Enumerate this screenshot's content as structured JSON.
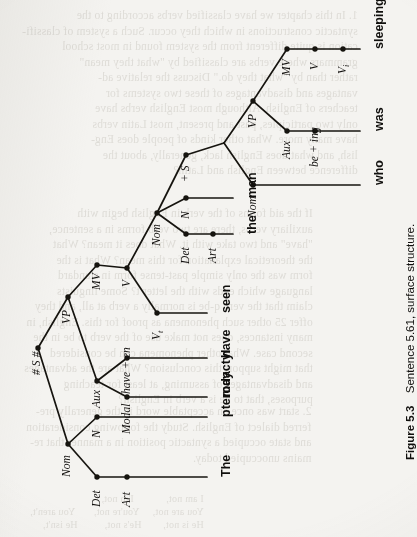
{
  "figure": {
    "caption_label": "Figure 5.3",
    "caption_text": "Sentence 5.61, surface structure.",
    "orientation": "rotated-90-ccw"
  },
  "tree": {
    "root_label": "# S #",
    "nodes": [
      {
        "id": "S",
        "label": "# S #",
        "style": "italic",
        "x": 38,
        "y": 348
      },
      {
        "id": "VP1",
        "label": "VP",
        "style": "italic",
        "x": 68,
        "y": 297
      },
      {
        "id": "Nom1",
        "label": "Nom",
        "style": "italic",
        "x": 68,
        "y": 444
      },
      {
        "id": "Det1",
        "label": "Det",
        "style": "italic",
        "x": 97,
        "y": 477
      },
      {
        "id": "N1",
        "label": "N",
        "style": "italic",
        "x": 97,
        "y": 417
      },
      {
        "id": "Art1",
        "label": "Art",
        "style": "italic",
        "x": 127,
        "y": 477
      },
      {
        "id": "Aux1",
        "label": "Aux",
        "style": "italic",
        "x": 97,
        "y": 381
      },
      {
        "id": "Modal",
        "label": "Modal",
        "style": "italic",
        "x": 127,
        "y": 397
      },
      {
        "id": "haveen",
        "label": "have + en",
        "style": "italic",
        "x": 127,
        "y": 358
      },
      {
        "id": "MV1",
        "label": "MV",
        "style": "italic",
        "x": 97,
        "y": 265
      },
      {
        "id": "V1",
        "label": "V",
        "style": "italic",
        "x": 127,
        "y": 268
      },
      {
        "id": "Vt",
        "label": "V",
        "sub": "t",
        "style": "italic",
        "x": 157,
        "y": 313
      },
      {
        "id": "Nom2",
        "label": "Nom",
        "style": "italic",
        "x": 157,
        "y": 213
      },
      {
        "id": "Det2",
        "label": "Det",
        "style": "italic",
        "x": 186,
        "y": 234
      },
      {
        "id": "Art2",
        "label": "Art",
        "style": "italic",
        "x": 213,
        "y": 234
      },
      {
        "id": "N2",
        "label": "N",
        "style": "italic",
        "x": 186,
        "y": 198
      },
      {
        "id": "S2",
        "label": "+ S",
        "style": "italic",
        "x": 186,
        "y": 155
      },
      {
        "id": "Nom3",
        "label": "Nom",
        "style": "italic",
        "x": 253,
        "y": 185
      },
      {
        "id": "VP2",
        "label": "VP",
        "style": "italic",
        "x": 253,
        "y": 101
      },
      {
        "id": "Aux2",
        "label": "Aux",
        "style": "italic",
        "x": 287,
        "y": 131
      },
      {
        "id": "being",
        "label": "be + ing",
        "style": "italic",
        "x": 315,
        "y": 131
      },
      {
        "id": "MV2",
        "label": "MV",
        "style": "italic",
        "x": 287,
        "y": 49
      },
      {
        "id": "V2",
        "label": "V",
        "style": "italic",
        "x": 315,
        "y": 49
      },
      {
        "id": "Vi",
        "label": "V",
        "sub": "i",
        "style": "italic",
        "x": 343,
        "y": 49
      }
    ],
    "terminals": [
      {
        "id": "t-the1",
        "text": "The",
        "y": 477
      },
      {
        "id": "t-ptero",
        "text": "pterodactyl",
        "y": 417
      },
      {
        "id": "t-may",
        "text": "may",
        "y": 397
      },
      {
        "id": "t-have",
        "text": "have",
        "y": 358
      },
      {
        "id": "t-seen",
        "text": "seen",
        "y": 313
      },
      {
        "id": "t-the2",
        "text": "the",
        "y": 234
      },
      {
        "id": "t-man",
        "text": "man",
        "y": 198
      },
      {
        "id": "t-who",
        "text": "who",
        "y": 185
      },
      {
        "id": "t-was",
        "text": "was",
        "y": 131
      },
      {
        "id": "t-sleep",
        "text": "sleeping",
        "y": 49
      }
    ],
    "sentence": "The pterodactyl may have seen the man who was sleeping"
  },
  "bleed_text": {
    "top": "1. In this chapter we have classified verbs according to the\nsyntactic constructions in which they occur. Such a system of classifi-\ncation is quite different from the system found in most school\ngrammars where verbs are classified by \"what they mean\"\nrather than by \"what they do.\" Discuss the relative ad-\nvantages and disadvantages of these two systems for\nteachers of English. Although most English verbs have\nonly two participles, past and present, most Latin verbs\nhave many more. What other kinds of people does Eng-\nlish, and what does English lack, generally, about the\ndifference between English and Latin?",
    "mid": "If the aid forms of the verb in English begin with\nauxiliary verbs, there are two verb forms in a sentence,\n\"have\" and two take with it. What does it mean? What\nthe theoretical explanation for this mean? What is the\nform was the only simple past-tense form in standard\nlanguage which ends with the letter t? Some linguists\nclaim that the verb q-be is normally a verb at all, and they\noffer 25 other such phenomena as proof for this. English, in\nmany instances, does not make use of the verb to be in the\nsecond case. What other phenomena can be considered\nthat might support this conclusion? What are the advantages\nand disadvantages of assuming, at least for teaching\npurposes, that to be is a verb in English?",
    "bottom": "2. start was once an acceptable word in the generally pre-\nferred dialect of English. Study the following consideration\nand state occupied a syntactic position in a manner that re-\nmains unoccupied today.",
    "tail": "I am not,            I'm not,\nYou are not,     You're not,       You aren't,\nHe is not,        He's not,          He isn't,"
  }
}
